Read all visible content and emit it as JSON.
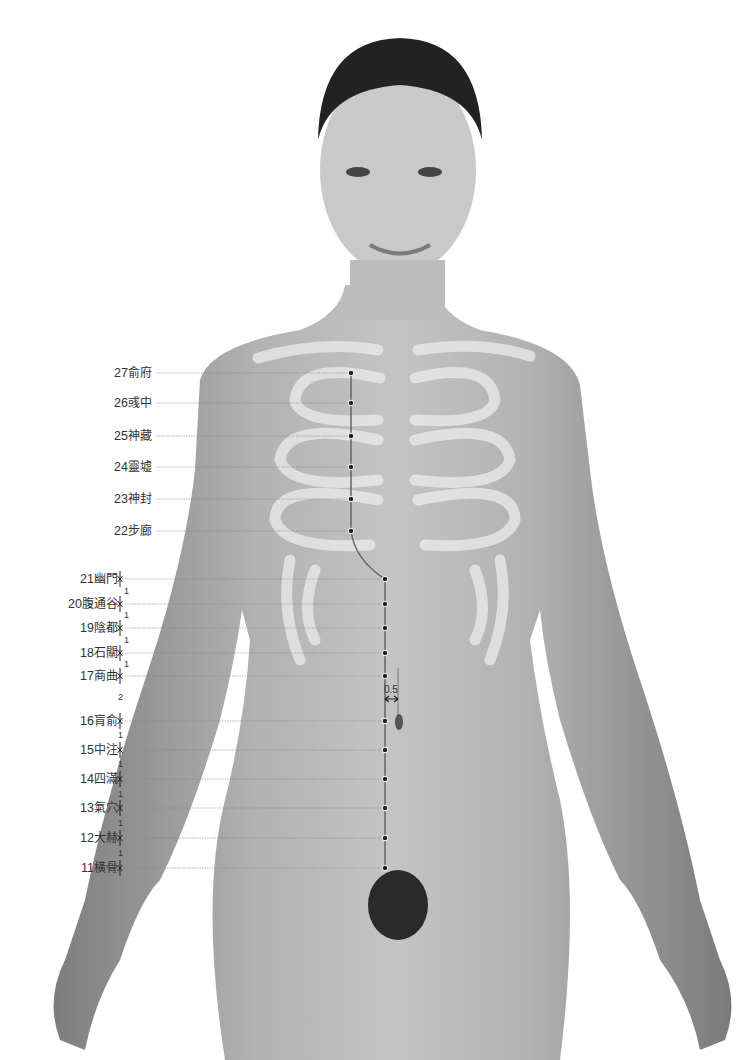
{
  "diagram": {
    "title": "",
    "meridian_color": "#666666",
    "point_color": "#222222",
    "points": [
      {
        "num": "27",
        "name": "俞府",
        "x": 351,
        "y": 373
      },
      {
        "num": "26",
        "name": "彧中",
        "x": 351,
        "y": 403
      },
      {
        "num": "25",
        "name": "神藏",
        "x": 351,
        "y": 436
      },
      {
        "num": "24",
        "name": "靈墟",
        "x": 351,
        "y": 467
      },
      {
        "num": "23",
        "name": "神封",
        "x": 351,
        "y": 499
      },
      {
        "num": "22",
        "name": "步廊",
        "x": 351,
        "y": 531
      },
      {
        "num": "21",
        "name": "幽門",
        "x": 385,
        "y": 579
      },
      {
        "num": "20",
        "name": "腹通谷",
        "x": 385,
        "y": 604
      },
      {
        "num": "19",
        "name": "陰都",
        "x": 385,
        "y": 628
      },
      {
        "num": "18",
        "name": "石關",
        "x": 385,
        "y": 653
      },
      {
        "num": "17",
        "name": "商曲",
        "x": 385,
        "y": 676
      },
      {
        "num": "16",
        "name": "肓俞",
        "x": 385,
        "y": 721
      },
      {
        "num": "15",
        "name": "中注",
        "x": 385,
        "y": 750
      },
      {
        "num": "14",
        "name": "四滿",
        "x": 385,
        "y": 779
      },
      {
        "num": "13",
        "name": "氣穴",
        "x": 385,
        "y": 808
      },
      {
        "num": "12",
        "name": "大赫",
        "x": 385,
        "y": 838
      },
      {
        "num": "11",
        "name": "橫骨",
        "x": 385,
        "y": 868
      }
    ],
    "measurements": [
      {
        "label": "1",
        "x": 124,
        "y": 591
      },
      {
        "label": "1",
        "x": 124,
        "y": 615
      },
      {
        "label": "1",
        "x": 124,
        "y": 640
      },
      {
        "label": "1",
        "x": 124,
        "y": 664
      },
      {
        "label": "2",
        "x": 118,
        "y": 697
      },
      {
        "label": "1",
        "x": 118,
        "y": 735
      },
      {
        "label": "1",
        "x": 118,
        "y": 764
      },
      {
        "label": "1",
        "x": 118,
        "y": 794
      },
      {
        "label": "1",
        "x": 118,
        "y": 823
      },
      {
        "label": "1",
        "x": 118,
        "y": 853
      }
    ],
    "offset_label": "0.5"
  }
}
